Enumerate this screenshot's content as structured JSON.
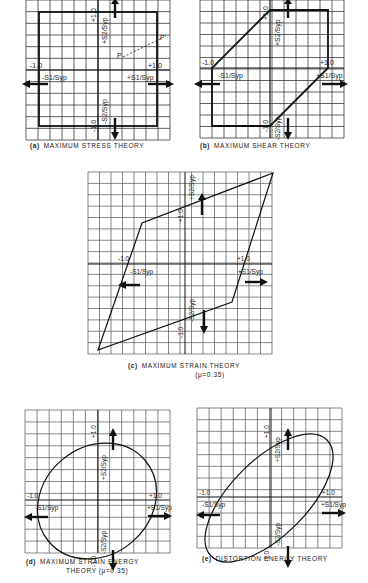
{
  "figure": {
    "panels": [
      {
        "id": "a",
        "tag": "(a)",
        "title": "MAXIMUM   STRESS   THEORY",
        "subtitle": "",
        "labels": {
          "pos_x_tick": "+1.0",
          "neg_x_tick": "-1.0",
          "pos_y_tick": "+1.0",
          "neg_y_tick": "-1.0",
          "pos_x_axis": "+S1/Syp",
          "neg_x_axis": "-S1/Syp",
          "pos_y_axis": "+S2/Syp",
          "neg_y_axis": "-S2/Syp",
          "point_p": "P",
          "point_p_prime": "P'"
        }
      },
      {
        "id": "b",
        "tag": "(b)",
        "title": "MAXIMUM  SHEAR  THEORY",
        "subtitle": "",
        "labels": {
          "pos_x_tick": "+1.0",
          "neg_x_tick": "-1.0",
          "pos_y_tick": "+1.0",
          "neg_y_tick": "-1.0",
          "pos_x_axis": "+S1/Syp",
          "neg_x_axis": "-S1/Syp",
          "pos_y_axis": "+S2/Syp",
          "neg_y_axis": "-S2/Syp"
        }
      },
      {
        "id": "c",
        "tag": "(c)",
        "title": "MAXIMUM   STRAIN   THEORY",
        "subtitle": "(μ=0.35)",
        "labels": {
          "pos_x_tick": "+1.0",
          "neg_x_tick": "-1.0",
          "pos_y_tick": "+1.0",
          "neg_y_tick": "-1.0",
          "pos_x_axis": "+S1/Syp",
          "neg_x_axis": "-S1/Syp",
          "pos_y_axis": "+S2/Syp",
          "neg_y_axis": "-S2/Syp"
        }
      },
      {
        "id": "d",
        "tag": "(d)",
        "title": "MAXIMUM   STRAIN   ENERGY",
        "subtitle": "THEORY  (μ=0.35)",
        "labels": {
          "pos_x_tick": "+1.0",
          "neg_x_tick": "-1.0",
          "pos_y_tick": "+1.0",
          "neg_y_tick": "-1.0",
          "pos_x_axis": "+S1/Syp",
          "neg_x_axis": "-S1/Syp",
          "pos_y_axis": "+S2/Syp",
          "neg_y_axis": "-S2/Syp"
        }
      },
      {
        "id": "e",
        "tag": "(e)",
        "title": "DISTORTION   ENERGY   THEORY",
        "subtitle": "",
        "labels": {
          "pos_x_tick": "+1.0",
          "neg_x_tick": "-1.0",
          "pos_y_tick": "+1.0",
          "neg_y_tick": "-1.0",
          "pos_x_axis": "+S1/Syp",
          "neg_x_axis": "-S1/Syp",
          "pos_y_axis": "+S2/Syp",
          "neg_y_axis": "-S2/Syp"
        }
      }
    ],
    "colors": {
      "ink": "#1a1a1a",
      "grid": "#3a3a3a",
      "paper": "#ffffff"
    }
  }
}
